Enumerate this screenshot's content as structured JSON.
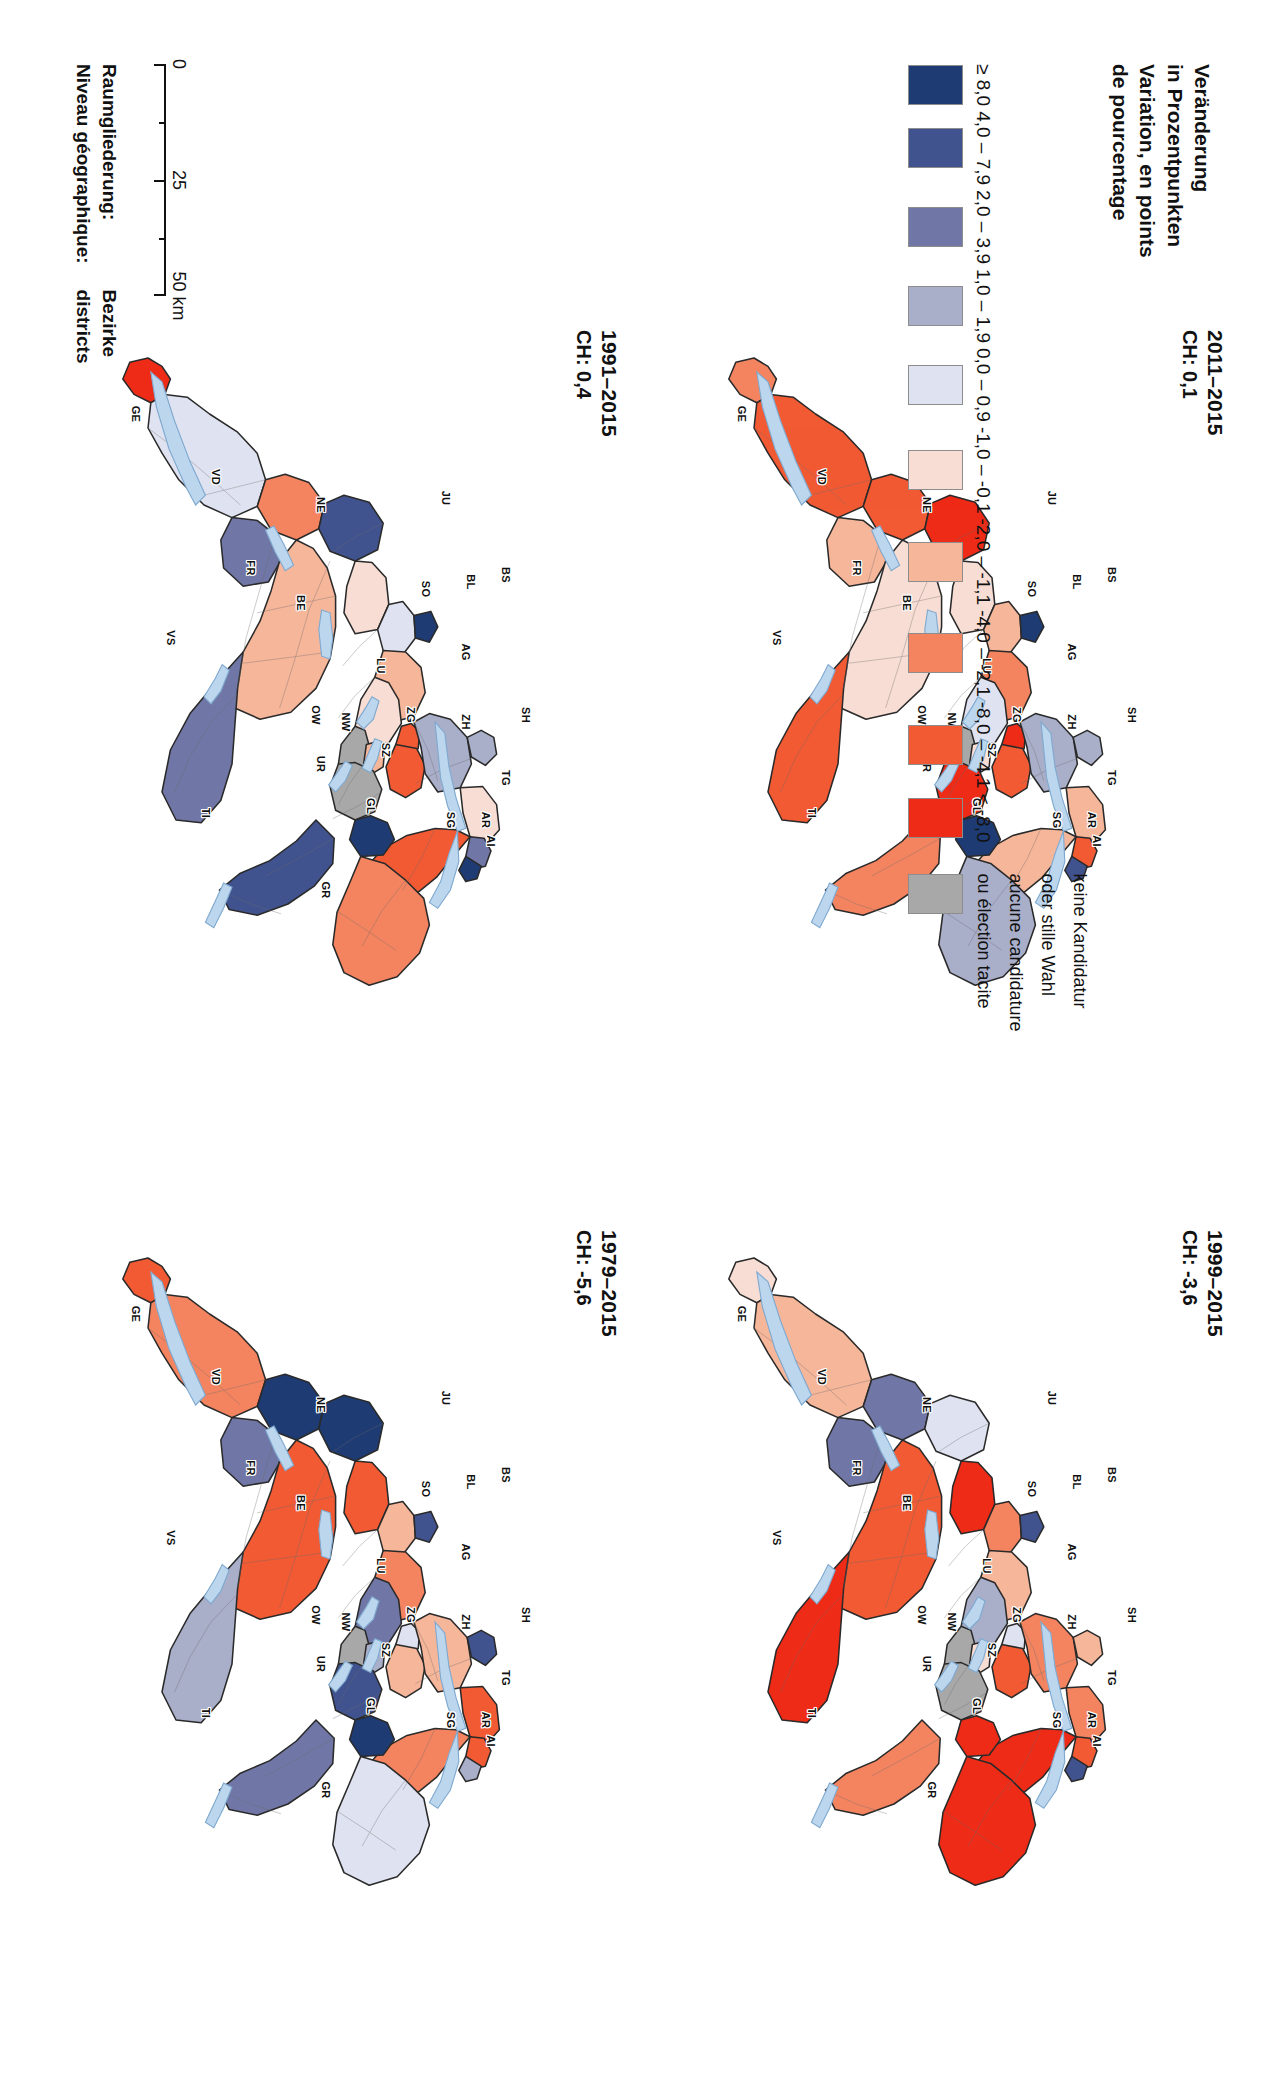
{
  "legend": {
    "title_de": "Veränderung",
    "title_de2": "in Prozentpunkten",
    "title_fr": "Variation, en points",
    "title_fr2": "de pourcentage",
    "classes": [
      {
        "label": "≥ 8,0",
        "color": "#1f3b73"
      },
      {
        "label": "4,0 – 7,9",
        "color": "#41538f"
      },
      {
        "label": "2,0 – 3,9",
        "color": "#7077a6"
      },
      {
        "label": "1,0 – 1,9",
        "color": "#a9aec9"
      },
      {
        "label": "0,0 – 0,9",
        "color": "#dfe2f0"
      },
      {
        "label": "-1,0 – -0,1",
        "color": "#f7ddd3"
      },
      {
        "label": "-2,0 – -1,1",
        "color": "#f6b69a"
      },
      {
        "label": "-4,0 – -2,1",
        "color": "#f4845f"
      },
      {
        "label": "-8,0 – -4,1",
        "color": "#f15a33"
      },
      {
        "label": "< -8,0",
        "color": "#ee2b17"
      }
    ],
    "no_data": {
      "color": "#a8a8a8",
      "line1": "keine Kandidatur",
      "line2": "oder stille Wahl",
      "line3": "aucune candidature",
      "line4": "ou élection tacite"
    }
  },
  "scale": {
    "ticks": [
      "0",
      "25",
      "50 km"
    ],
    "unit": "km"
  },
  "geo": {
    "label_de": "Raumgliederung:",
    "value_de": "Bezirke",
    "label_fr": "Niveau géographique:",
    "value_fr": "districts"
  },
  "panels": [
    {
      "id": "p2011",
      "title": "2011–2015",
      "sub": "CH: 0,1"
    },
    {
      "id": "p1999",
      "title": "1999–2015",
      "sub": "CH: -3,6"
    },
    {
      "id": "p1991",
      "title": "1991–2015",
      "sub": "CH: 0,4"
    },
    {
      "id": "p1979",
      "title": "1979–2015",
      "sub": "CH: -5,6"
    }
  ],
  "canton_labels": [
    {
      "code": "GE",
      "x": 12,
      "y": 86
    },
    {
      "code": "VD",
      "x": 21,
      "y": 70
    },
    {
      "code": "NE",
      "x": 25,
      "y": 49
    },
    {
      "code": "JU",
      "x": 24,
      "y": 24
    },
    {
      "code": "FR",
      "x": 34,
      "y": 63
    },
    {
      "code": "BE",
      "x": 39,
      "y": 53
    },
    {
      "code": "VS",
      "x": 44,
      "y": 79
    },
    {
      "code": "SO",
      "x": 37,
      "y": 28
    },
    {
      "code": "BL",
      "x": 36,
      "y": 19
    },
    {
      "code": "BS",
      "x": 35,
      "y": 12
    },
    {
      "code": "AG",
      "x": 46,
      "y": 20
    },
    {
      "code": "LU",
      "x": 48,
      "y": 37
    },
    {
      "code": "OW",
      "x": 55,
      "y": 50
    },
    {
      "code": "NW",
      "x": 56,
      "y": 44
    },
    {
      "code": "UR",
      "x": 62,
      "y": 49
    },
    {
      "code": "ZG",
      "x": 55,
      "y": 31
    },
    {
      "code": "SZ",
      "x": 60,
      "y": 36
    },
    {
      "code": "ZH",
      "x": 56,
      "y": 20
    },
    {
      "code": "SH",
      "x": 55,
      "y": 8
    },
    {
      "code": "TG",
      "x": 64,
      "y": 12
    },
    {
      "code": "AR",
      "x": 70,
      "y": 16
    },
    {
      "code": "AI",
      "x": 73,
      "y": 15
    },
    {
      "code": "SG",
      "x": 70,
      "y": 23
    },
    {
      "code": "GL",
      "x": 68,
      "y": 39
    },
    {
      "code": "GR",
      "x": 80,
      "y": 48
    },
    {
      "code": "TI",
      "x": 69,
      "y": 72
    }
  ],
  "chart_data": {
    "type": "heatmap",
    "legend_position": "bottom-left",
    "maps": [
      {
        "period": "2011–2015",
        "national_value": 0.1,
        "national_label": "CH: 0,1"
      },
      {
        "period": "1999–2015",
        "national_value": -3.6,
        "national_label": "CH: -3,6"
      },
      {
        "period": "1991–2015",
        "national_value": 0.4,
        "national_label": "CH: 0,4"
      },
      {
        "period": "1979–2015",
        "national_value": -5.6,
        "national_label": "CH: -5,6"
      }
    ],
    "class_breaks": [
      8.0,
      4.0,
      2.0,
      1.0,
      0.0,
      -1.0,
      -2.0,
      -4.0,
      -8.0
    ],
    "class_labels": [
      "≥ 8,0",
      "4,0 – 7,9",
      "2,0 – 3,9",
      "1,0 – 1,9",
      "0,0 – 0,9",
      "-1,0 – -0,1",
      "-2,0 – -1,1",
      "-4,0 – -2,1",
      "-8,0 – -4,1",
      "< -8,0"
    ],
    "class_colors": [
      "#1f3b73",
      "#41538f",
      "#7077a6",
      "#a9aec9",
      "#dfe2f0",
      "#f7ddd3",
      "#f6b69a",
      "#f4845f",
      "#f15a33",
      "#ee2b17"
    ],
    "nodata_color": "#a8a8a8",
    "geographic_level": "Bezirke / districts",
    "scale_ticks_km": [
      0,
      25,
      50
    ]
  }
}
